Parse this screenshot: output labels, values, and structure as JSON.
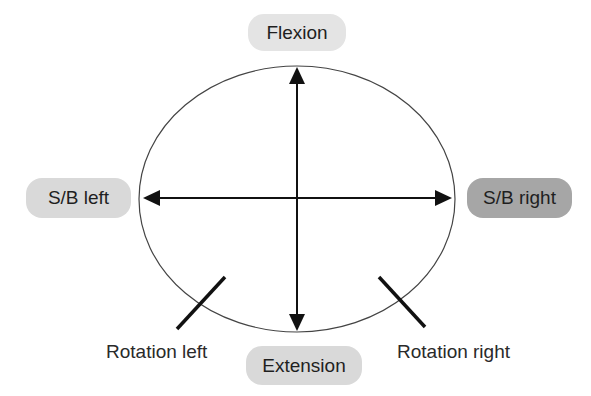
{
  "diagram": {
    "labels": {
      "flexion": "Flexion",
      "extension": "Extension",
      "sb_left": "S/B left",
      "sb_right": "S/B right",
      "rotation_left": "Rotation left",
      "rotation_right": "Rotation right"
    },
    "colors": {
      "pill_light": "#d9d9d9",
      "pill_lighter": "#e4e4e4",
      "pill_dark": "#a6a6a6",
      "stroke": "#111111",
      "ellipse_stroke": "#444444"
    },
    "highlighted": "S/B right"
  }
}
